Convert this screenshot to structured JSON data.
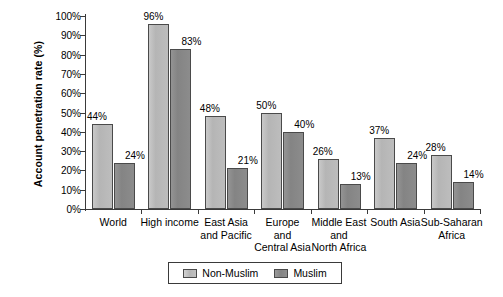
{
  "chart_data": {
    "type": "bar",
    "title": "",
    "xlabel": "",
    "ylabel": "Account penetration rate (%)",
    "ylim": [
      0,
      100
    ],
    "ytick_labels": [
      "100%",
      "90%",
      "80%",
      "70%",
      "60%",
      "50%",
      "40%",
      "30%",
      "20%",
      "10%",
      "0%"
    ],
    "ytick_values": [
      100,
      90,
      80,
      70,
      60,
      50,
      40,
      30,
      20,
      10,
      0
    ],
    "grid": false,
    "legend_position": "bottom",
    "categories": [
      "World",
      "High income",
      "East Asia\nand Pacific",
      "Europe\nand\nCentral Asia",
      "Middle East\nand\nNorth Africa",
      "South Asia",
      "Sub-Saharan\nAfrica"
    ],
    "series": [
      {
        "name": "Non-Muslim",
        "color": "#bdbdbd",
        "values": [
          44,
          96,
          48,
          50,
          26,
          37,
          28
        ],
        "value_labels": [
          "44%",
          "96%",
          "48%",
          "50%",
          "26%",
          "37%",
          "28%"
        ]
      },
      {
        "name": "Muslim",
        "color": "#8c8c8c",
        "values": [
          24,
          83,
          21,
          40,
          13,
          24,
          14
        ],
        "value_labels": [
          "24%",
          "83%",
          "21%",
          "40%",
          "13%",
          "24%",
          "14%"
        ]
      }
    ]
  },
  "legend": {
    "entries": [
      {
        "label": "Non-Muslim",
        "swatch": "light-gray-swatch"
      },
      {
        "label": "Muslim",
        "swatch": "dark-gray-swatch"
      }
    ]
  }
}
